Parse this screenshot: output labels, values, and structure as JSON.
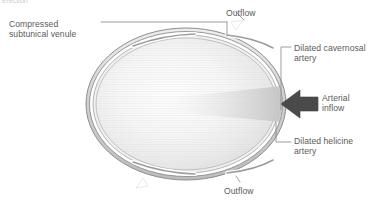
{
  "figure": {
    "title_fragment": "Erection",
    "background_color": "#ffffff",
    "label_color": "#5b5b5b",
    "leader_color": "#8a8a8a",
    "arrow_color": "#4a4a4a",
    "ring_color": "#9a9a9a",
    "ring_fill": "#d8d8d8",
    "interior_fill": "#f2f2f2"
  },
  "labels": {
    "compressed_venule": "Compressed\nsubtunical venule",
    "outflow_top": "Outflow",
    "dilated_cavernosal_artery": "Dilated cavernosal\nartery",
    "arterial_inflow": "Arterial\ninflow",
    "dilated_helicine_artery": "Dilated helicine\nartery",
    "outflow_bottom": "Outflow"
  },
  "icons": {
    "arterial_inflow_arrow": "arrow-left-icon",
    "outflow_arrow_top": "outflow-arrow-icon",
    "outflow_arrow_bottom": "outflow-arrow-icon"
  },
  "anatomy": {
    "tunica_albuginea": "outer concentric oval ring",
    "venule_gaps": 4,
    "sinusoid_texture": "horizontal hatch gradient"
  }
}
